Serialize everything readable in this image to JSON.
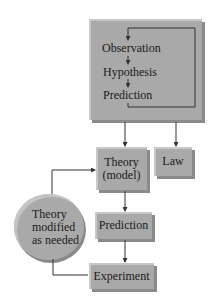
{
  "diagram": {
    "type": "flowchart",
    "top_box": {
      "steps": [
        "Observation",
        "Hypothesis",
        "Prediction"
      ]
    },
    "nodes": {
      "theory": {
        "line1": "Theory",
        "line2": "(model)"
      },
      "law": {
        "label": "Law"
      },
      "prediction": {
        "label": "Prediction"
      },
      "experiment": {
        "label": "Experiment"
      },
      "modify": {
        "line1": "Theory",
        "line2": "modified",
        "line3": "as needed"
      }
    },
    "colors": {
      "box_fill": "#a9a9a9",
      "line": "#333333"
    }
  }
}
